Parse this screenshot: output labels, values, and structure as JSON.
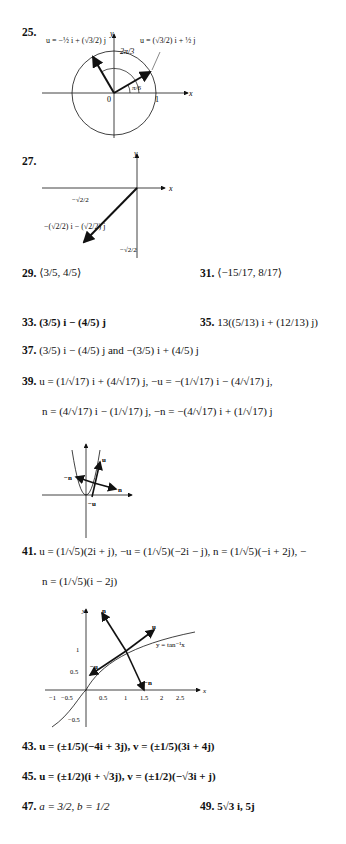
{
  "answers": {
    "a25": {
      "number": "25.",
      "label_left": "u = −½ i + (√3/2) j",
      "label_right": "u = (√3/2) i + ½ j",
      "angle_large": "2π/3",
      "angle_small": "π/6",
      "origin": "0",
      "tick_x": "1",
      "axis_x": "x",
      "axis_y": "y"
    },
    "a27": {
      "number": "27.",
      "vector_label": "−(√2/2) i − (√2/2) j",
      "tick_x": "−√2/2",
      "tick_y": "−√2/2",
      "axis_x": "x",
      "axis_y": "y"
    },
    "a29": {
      "number": "29.",
      "text": "⟨3/5, 4/5⟩"
    },
    "a31": {
      "number": "31.",
      "text": "⟨−15/17, 8/17⟩"
    },
    "a33": {
      "number": "33.",
      "text": "(3/5) i − (4/5) j"
    },
    "a35": {
      "number": "35.",
      "text": "13((5/13) i + (12/13) j)"
    },
    "a37": {
      "number": "37.",
      "text": "(3/5) i − (4/5) j and −(3/5) i + (4/5) j",
      "and": "and"
    },
    "a39": {
      "number": "39.",
      "line1": "u = (1/√17) i + (4/√17) j, −u = −(1/√17) i − (4/√17) j,",
      "line2": "n = (4/√17) i − (1/√17) j, −n = −(4/√17) i + (1/√17) j",
      "fig": {
        "labels": [
          "u",
          "−u",
          "n",
          "−n"
        ],
        "axis_x": "x",
        "axis_y": "y"
      }
    },
    "a41": {
      "number": "41.",
      "line1": "u = (1/√5)(2i + j), −u = (1/√5)(−2i − j), n = (1/√5)(−i + 2j), −",
      "line2": "n = (1/√5)(i − 2j)",
      "fig": {
        "curve_label": "y = tan⁻¹x",
        "labels": [
          "u",
          "−u",
          "n",
          "−n"
        ],
        "x_ticks": [
          "−1",
          "−0.5",
          "0.5",
          "1",
          "1.5",
          "2",
          "2.5"
        ],
        "y_ticks": [
          "1",
          "0.5",
          "−0.5"
        ],
        "axis_x": "x",
        "axis_y": "y"
      }
    },
    "a43": {
      "number": "43.",
      "text": "u = (±1/5)(−4i + 3j), v = (±1/5)(3i + 4j)"
    },
    "a45": {
      "number": "45.",
      "text": "u = (±1/2)(i + √3j), v = (±1/2)(−√3i + j)"
    },
    "a47": {
      "number": "47.",
      "text": "a = 3/2, b = 1/2"
    },
    "a49": {
      "number": "49.",
      "text": "5√3 i, 5j"
    }
  }
}
